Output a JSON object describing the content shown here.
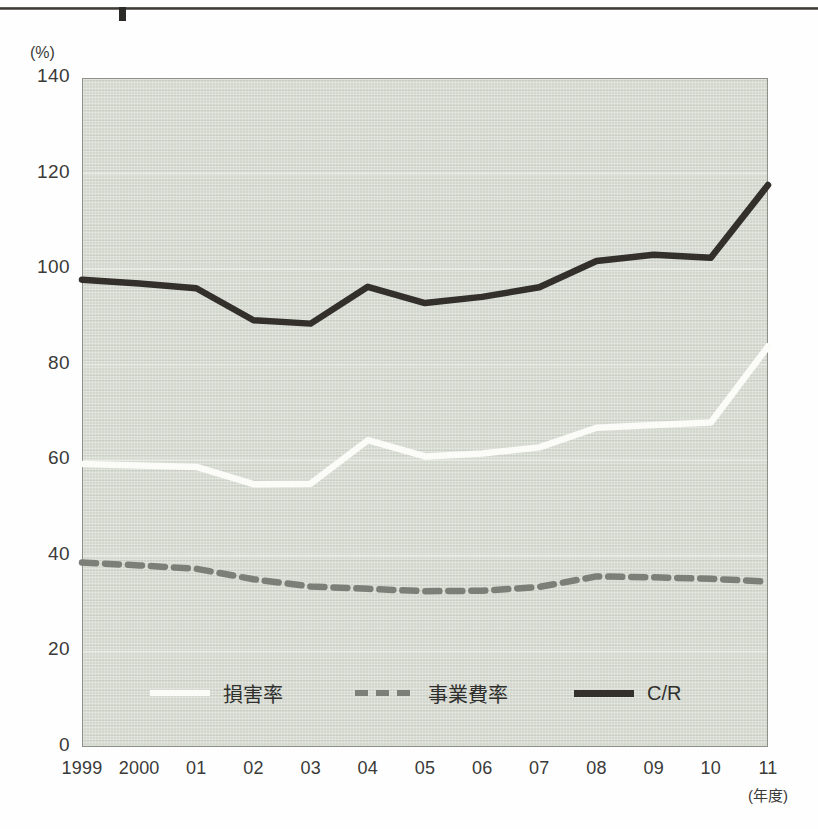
{
  "page": {
    "top_rule": "horizontal-rule",
    "background_color": "#fefefe"
  },
  "chart_colors": {
    "plot_background": "#d3d7cd",
    "plot_border": "#8d9189",
    "loss_ratio_line": "#fbfbf7",
    "expense_ratio_line": "#7c7f77",
    "combined_ratio_line": "#332f2a",
    "gridline": "#e8eae4",
    "text": "#3a3a38"
  },
  "axes": {
    "y_unit_label": "(%)",
    "y_ticks": [
      "140",
      "120",
      "100",
      "80",
      "60",
      "40",
      "20",
      "0"
    ],
    "x_unit_label": "(年度)",
    "x_ticks": [
      "1999",
      "2000",
      "01",
      "02",
      "03",
      "04",
      "05",
      "06",
      "07",
      "08",
      "09",
      "10",
      "11"
    ]
  },
  "legend": {
    "items": [
      {
        "label": "損害率",
        "style": "solid",
        "color": "#fbfbf7"
      },
      {
        "label": "事業費率",
        "style": "dashed",
        "color": "#7c7f77"
      },
      {
        "label": "C/R",
        "style": "solid",
        "color": "#332f2a"
      }
    ]
  },
  "chart_data": {
    "type": "line",
    "title": "",
    "xlabel": "(年度)",
    "ylabel": "(%)",
    "ylim": [
      0,
      140
    ],
    "ytick_step": 20,
    "grid": true,
    "legend_position": "bottom",
    "categories": [
      "1999",
      "2000",
      "01",
      "02",
      "03",
      "04",
      "05",
      "06",
      "07",
      "08",
      "09",
      "10",
      "11"
    ],
    "series": [
      {
        "name": "損害率",
        "style": "solid",
        "color": "#fbfbf7",
        "values": [
          59.2,
          58.9,
          58.6,
          55.0,
          55.1,
          64.2,
          60.8,
          61.4,
          62.7,
          66.8,
          67.4,
          67.9,
          83.8
        ]
      },
      {
        "name": "事業費率",
        "style": "dashed",
        "color": "#7c7f77",
        "values": [
          38.6,
          38.0,
          37.3,
          35.1,
          33.6,
          33.1,
          32.6,
          32.7,
          33.5,
          35.7,
          35.5,
          35.2,
          34.6
        ]
      },
      {
        "name": "C/R",
        "style": "solid",
        "color": "#332f2a",
        "values": [
          97.8,
          97.0,
          96.0,
          89.3,
          88.6,
          96.3,
          92.9,
          94.2,
          96.2,
          101.7,
          103.0,
          102.4,
          117.6
        ]
      }
    ]
  }
}
